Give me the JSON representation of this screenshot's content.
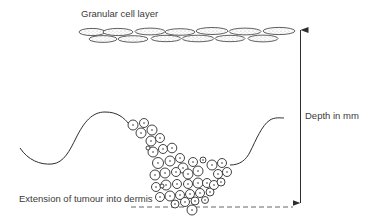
{
  "diagram": {
    "labels": {
      "granular_layer": "Granular cell layer",
      "depth": "Depth in mm",
      "extension": "Extension of tumour into dermis"
    },
    "elements": {
      "granular_cells": "granular-cell-layer",
      "epidermis_line": "epidermal-dermal-junction",
      "tumour_cells": "tumour-cell-cluster",
      "depth_arrow": "double-headed-depth-arrow",
      "extension_line": "dashed-extension-baseline"
    },
    "colors": {
      "line": "#2e2e2e",
      "text": "#3a3a3a",
      "background": "#ffffff"
    }
  }
}
